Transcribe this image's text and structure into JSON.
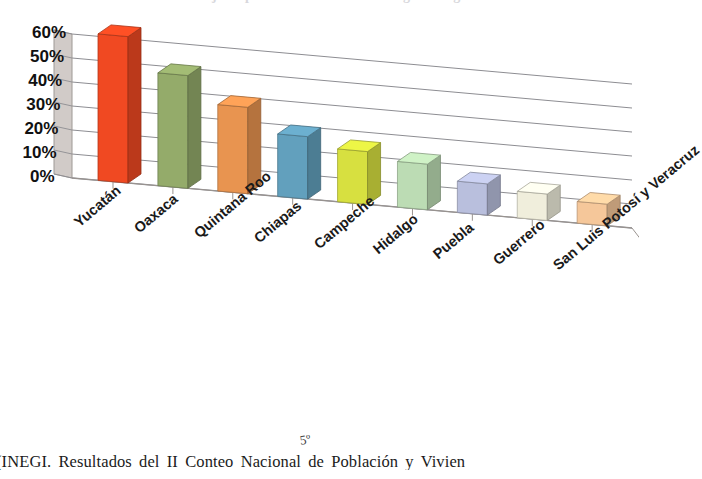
{
  "figure": {
    "title": "Porcentaje de población hablante de lengua indígena",
    "caption": "(INEGI. Resultados del II Conteo Nacional de Población y Vivien",
    "stray_mark": "5º"
  },
  "chart_data": {
    "type": "bar",
    "title": "Porcentaje de población hablante de lengua indígena",
    "xlabel": "",
    "ylabel": "",
    "ylim": [
      0,
      60
    ],
    "grid": true,
    "legend": "none",
    "perspective": "3d",
    "categories": [
      "Yucatán",
      "Oaxaca",
      "Quintana Roo",
      "Chiapas",
      "Campeche",
      "Hidalgo",
      "Puebla",
      "Guerrero",
      "San Luis Potosí y Veracruz"
    ],
    "values": [
      61,
      47,
      36,
      26,
      22,
      19,
      13,
      11,
      9
    ],
    "ticklabels": [
      "60%",
      "50%",
      "40%",
      "30%",
      "20%",
      "10%",
      "0%"
    ],
    "tickvalues": [
      60,
      50,
      40,
      30,
      20,
      10,
      0
    ],
    "colors": [
      "#f04922",
      "#94ab6a",
      "#e89450",
      "#62a0bd",
      "#d7e040",
      "#bcdcb4",
      "#b9bfdd",
      "#f0eedc",
      "#f5c79a"
    ]
  }
}
